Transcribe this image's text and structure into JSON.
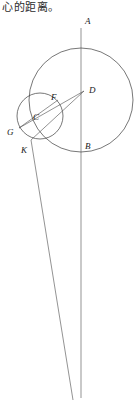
{
  "caption": {
    "text": "心的距离。"
  },
  "figure": {
    "name": "circle-geometry-construction",
    "stroke_color": "#3c3c3c",
    "background_color": "#ffffff",
    "labels": [
      {
        "id": "A",
        "text": "A",
        "x": 85,
        "y": 24
      },
      {
        "id": "D",
        "text": "D",
        "x": 89,
        "y": 93
      },
      {
        "id": "F",
        "text": "F",
        "x": 51,
        "y": 100
      },
      {
        "id": "C",
        "text": "C",
        "x": 33,
        "y": 120
      },
      {
        "id": "G",
        "text": "G",
        "x": 9,
        "y": 135
      },
      {
        "id": "K",
        "text": "K",
        "x": 22,
        "y": 152
      },
      {
        "id": "B",
        "text": "B",
        "x": 85,
        "y": 148
      }
    ],
    "circles": [
      {
        "id": "large-circle",
        "cx": 81,
        "cy": 100,
        "r": 52
      },
      {
        "id": "small-circle",
        "cx": 40,
        "cy": 116,
        "r": 23
      }
    ],
    "segments": [
      {
        "id": "vertical-axis-AB",
        "x1": 81,
        "y1": 28,
        "x2": 81,
        "y2": 398
      },
      {
        "id": "line-K-down",
        "x1": 31,
        "y1": 140,
        "x2": 73,
        "y2": 400
      },
      {
        "id": "line-D-to-G",
        "x1": 84,
        "y1": 91,
        "x2": 19,
        "y2": 128
      },
      {
        "id": "line-D-to-K",
        "x1": 84,
        "y1": 91,
        "x2": 31,
        "y2": 140
      },
      {
        "id": "line-C-chord",
        "x1": 19,
        "y1": 128,
        "x2": 57,
        "y2": 101
      }
    ],
    "points": [
      {
        "id": "A",
        "x": 81,
        "y": 28
      },
      {
        "id": "B",
        "x": 81,
        "y": 150
      },
      {
        "id": "D",
        "x": 84,
        "y": 91
      },
      {
        "id": "F",
        "x": 50,
        "y": 103
      },
      {
        "id": "C",
        "x": 40,
        "y": 116
      },
      {
        "id": "G",
        "x": 19,
        "y": 128
      },
      {
        "id": "K",
        "x": 31,
        "y": 140
      }
    ]
  }
}
